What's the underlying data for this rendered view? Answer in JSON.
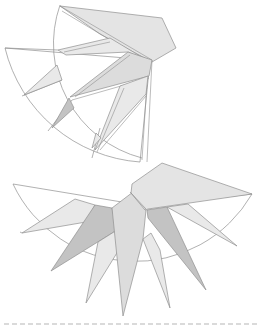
{
  "figure": {
    "caption": "",
    "upper_diagram": {
      "label": "Partially folded fan net (upper)",
      "colors": {
        "outline": "#8f8f8f",
        "light_fill": "#e9e9e9",
        "mid_fill": "#dcdcdc",
        "dark_fill": "#c3c3c3",
        "cap_fill": "#e4e4e4"
      }
    },
    "lower_diagram": {
      "label": "Flat fan net with radial spikes (lower)",
      "spike_count": 9,
      "colors": {
        "outline": "#8f8f8f",
        "light_fill": "#e9e9e9",
        "mid_fill": "#dcdcdc",
        "dark_fill": "#c3c3c3",
        "cap_fill": "#e4e4e4"
      }
    },
    "cut_line": {
      "style": "dashed",
      "color": "#b5b5b5"
    }
  }
}
